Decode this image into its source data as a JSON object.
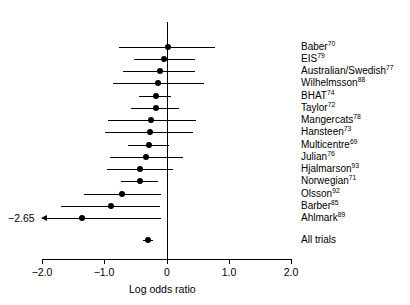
{
  "chart_data": {
    "type": "forest",
    "title": "",
    "xlabel": "Log odds ratio",
    "ylabel": "",
    "xlim": [
      -2.0,
      2.0
    ],
    "xticks": [
      -2.0,
      -1.0,
      0.0,
      1.0,
      2.0
    ],
    "xticklabels": [
      "−2.0",
      "−1.0",
      "0",
      "1.0",
      "2.0"
    ],
    "grid": false,
    "legend": null,
    "reference_line": 0.0,
    "annotations": [
      {
        "text": "−2.65",
        "for_row": "Ahlmark",
        "meaning": "lower confidence limit beyond axis range, arrow clipped"
      }
    ],
    "rows": [
      {
        "label": "Baber",
        "superscript": "70",
        "estimate": 0.01,
        "ci_low": -0.77,
        "ci_high": 0.77,
        "clipped_low": false
      },
      {
        "label": "EIS",
        "superscript": "79",
        "estimate": -0.05,
        "ci_low": -0.53,
        "ci_high": 0.45,
        "clipped_low": false
      },
      {
        "label": "Australian/Swedish",
        "superscript": "77",
        "estimate": -0.12,
        "ci_low": -0.7,
        "ci_high": 0.45,
        "clipped_low": false
      },
      {
        "label": "Wilhelmsson",
        "superscript": "88",
        "estimate": -0.14,
        "ci_low": -0.87,
        "ci_high": 0.6,
        "clipped_low": false
      },
      {
        "label": "BHAT",
        "superscript": "74",
        "estimate": -0.18,
        "ci_low": -0.45,
        "ci_high": 0.07,
        "clipped_low": false
      },
      {
        "label": "Taylor",
        "superscript": "72",
        "estimate": -0.17,
        "ci_low": -0.57,
        "ci_high": 0.2,
        "clipped_low": false
      },
      {
        "label": "Mangercats",
        "superscript": "78",
        "estimate": -0.25,
        "ci_low": -0.95,
        "ci_high": 0.46,
        "clipped_low": false
      },
      {
        "label": "Hansteen",
        "superscript": "73",
        "estimate": -0.27,
        "ci_low": -1.0,
        "ci_high": 0.41,
        "clipped_low": false
      },
      {
        "label": "Multicentre",
        "superscript": "69",
        "estimate": -0.29,
        "ci_low": -0.62,
        "ci_high": 0.04,
        "clipped_low": false
      },
      {
        "label": "Julian",
        "superscript": "76",
        "estimate": -0.33,
        "ci_low": -0.92,
        "ci_high": 0.26,
        "clipped_low": false
      },
      {
        "label": "Hjalmarson",
        "superscript": "93",
        "estimate": -0.43,
        "ci_low": -0.97,
        "ci_high": 0.09,
        "clipped_low": false
      },
      {
        "label": "Norwegian",
        "superscript": "71",
        "estimate": -0.44,
        "ci_low": -0.74,
        "ci_high": -0.15,
        "clipped_low": false
      },
      {
        "label": "Olsson",
        "superscript": "92",
        "estimate": -0.72,
        "ci_low": -1.33,
        "ci_high": -0.09,
        "clipped_low": false
      },
      {
        "label": "Barber",
        "superscript": "85",
        "estimate": -0.9,
        "ci_low": -1.7,
        "ci_high": -0.12,
        "clipped_low": false
      },
      {
        "label": "Ahlmark",
        "superscript": "89",
        "estimate": -1.36,
        "ci_low": -2.65,
        "ci_high": -0.1,
        "clipped_low": true
      },
      {
        "label": "All trials",
        "superscript": "",
        "estimate": -0.3,
        "ci_low": -0.38,
        "ci_high": -0.22,
        "clipped_low": false
      }
    ]
  }
}
